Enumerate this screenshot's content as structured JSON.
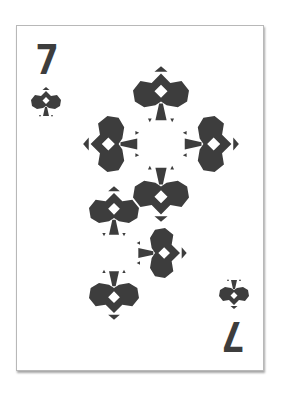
{
  "card": {
    "rank": "7",
    "suit": "spades",
    "suit_icon": "spade-icon",
    "ink_color": "#3d3d3d",
    "background": "#ffffff",
    "corner_index": {
      "top_left": {
        "rank": "7",
        "suit": "spades"
      },
      "bottom_right": {
        "rank": "7",
        "suit": "spades",
        "rotated": true
      }
    },
    "pip_count": 7,
    "pips": [
      {
        "position": "top",
        "rotation": 0
      },
      {
        "position": "cross-left",
        "rotation": -90
      },
      {
        "position": "cross-right",
        "rotation": 90
      },
      {
        "position": "cross-bottom",
        "rotation": 180
      },
      {
        "position": "lower-left",
        "rotation": 0
      },
      {
        "position": "lower-middle-right",
        "rotation": 90
      },
      {
        "position": "bottom-left",
        "rotation": 180
      }
    ]
  }
}
